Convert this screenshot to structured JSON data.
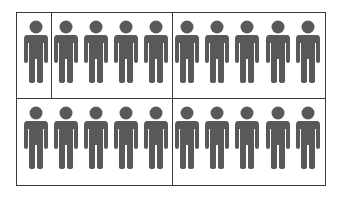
{
  "chart_data": {
    "type": "pictograph",
    "title": "",
    "icon": "person-icon",
    "icon_color": "#595959",
    "total_icons": 20,
    "rows": 2,
    "icons_per_row": 10,
    "groups": [
      {
        "row": 1,
        "count": 1
      },
      {
        "row": 1,
        "count": 4
      },
      {
        "row": 1,
        "count": 5
      },
      {
        "row": 2,
        "count": 5
      },
      {
        "row": 2,
        "count": 5
      }
    ],
    "x": [
      36,
      66,
      96,
      126,
      156,
      187,
      217,
      247,
      278,
      308
    ],
    "row_tops": [
      19,
      105
    ],
    "dividers": {
      "horizontal_y": [
        98
      ],
      "vertical": [
        {
          "x": 51,
          "y1": 12,
          "y2": 98
        },
        {
          "x": 172,
          "y1": 12,
          "y2": 98
        },
        {
          "x": 172,
          "y1": 98,
          "y2": 186
        }
      ]
    },
    "frame": {
      "x": 16,
      "y": 12,
      "width": 310,
      "height": 174,
      "color": "#3a3a3a"
    }
  }
}
